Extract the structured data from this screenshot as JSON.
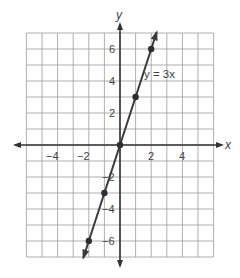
{
  "chart_data": {
    "type": "line",
    "title": "",
    "xlabel": "x",
    "ylabel": "y",
    "xlim": [
      -6,
      6
    ],
    "ylim": [
      -7,
      7
    ],
    "grid": true,
    "x_ticks": [
      -4,
      -2,
      2,
      4
    ],
    "y_ticks": [
      6,
      4,
      2,
      -2,
      -4,
      -6
    ],
    "x_tick_labels": [
      "−4",
      "−2",
      "2",
      "4"
    ],
    "y_tick_labels": [
      "6",
      "4",
      "2",
      "−2",
      "−4",
      "−6"
    ],
    "series": [
      {
        "name": "y = 3x",
        "equation": "y = 3x",
        "points": [
          [
            -2,
            -6
          ],
          [
            -1,
            -3
          ],
          [
            0,
            0
          ],
          [
            1,
            3
          ],
          [
            2,
            6
          ]
        ],
        "x": [
          -2,
          -1,
          0,
          1,
          2
        ],
        "y": [
          -6,
          -3,
          0,
          3,
          6
        ],
        "line_extends_with_arrows": true
      }
    ],
    "annotations": [
      {
        "text": "y = 3x",
        "x": 2.0,
        "y": 4.5
      }
    ]
  },
  "labels": {
    "x_axis": "x",
    "y_axis": "y",
    "equation": "y = 3x"
  },
  "colors": {
    "grid": "#9a9a9a",
    "axis": "#333333",
    "line": "#3a3a3a",
    "text": "#444444"
  }
}
